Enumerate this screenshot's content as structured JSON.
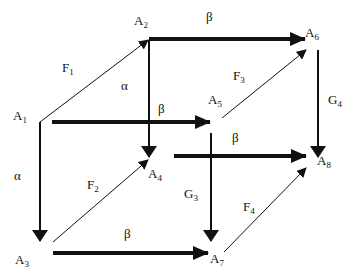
{
  "diagram": {
    "type": "cube commutative diagram",
    "nodes": [
      {
        "id": "A1",
        "base": "A",
        "sub": "1",
        "x": 14,
        "y": 118
      },
      {
        "id": "A2",
        "base": "A",
        "sub": "2",
        "x": 135,
        "y": 23
      },
      {
        "id": "A3",
        "base": "A",
        "sub": "3",
        "x": 16,
        "y": 262
      },
      {
        "id": "A4",
        "base": "A",
        "sub": "4",
        "x": 148,
        "y": 176
      },
      {
        "id": "A5",
        "base": "A",
        "sub": "5",
        "x": 207,
        "y": 103
      },
      {
        "id": "A6",
        "base": "A",
        "sub": "6",
        "x": 306,
        "y": 36
      },
      {
        "id": "A7",
        "base": "A",
        "sub": "7",
        "x": 210,
        "y": 261
      },
      {
        "id": "A8",
        "base": "A",
        "sub": "8",
        "x": 317,
        "y": 164
      }
    ],
    "edges": [
      {
        "from": "A1",
        "to": "A2",
        "label": "F",
        "label_sub": "1",
        "style": "thin"
      },
      {
        "from": "A3",
        "to": "A4",
        "label": "F",
        "label_sub": "2",
        "style": "thin"
      },
      {
        "from": "A5",
        "to": "A6",
        "label": "F",
        "label_sub": "3",
        "style": "thin"
      },
      {
        "from": "A7",
        "to": "A8",
        "label": "F",
        "label_sub": "4",
        "style": "thin"
      },
      {
        "from": "A1",
        "to": "A3",
        "label": "α",
        "style": "medium"
      },
      {
        "from": "A2",
        "to": "A4",
        "label": "α",
        "style": "medium"
      },
      {
        "from": "A5",
        "to": "A7",
        "label": "G",
        "label_sub": "3",
        "style": "medium"
      },
      {
        "from": "A6",
        "to": "A8",
        "label": "G",
        "label_sub": "4",
        "style": "medium"
      },
      {
        "from": "A1",
        "to": "A5",
        "label": "β",
        "style": "thick"
      },
      {
        "from": "A2",
        "to": "A6",
        "label": "β",
        "style": "thick"
      },
      {
        "from": "A3",
        "to": "A7",
        "label": "β",
        "style": "thick"
      },
      {
        "from": "A4",
        "to": "A8",
        "label": "β",
        "style": "thick"
      }
    ]
  },
  "labels": {
    "a1": "A",
    "a1_sub": "1",
    "a2": "A",
    "a2_sub": "2",
    "a3": "A",
    "a3_sub": "3",
    "a4": "A",
    "a4_sub": "4",
    "a5": "A",
    "a5_sub": "5",
    "a6": "A",
    "a6_sub": "6",
    "a7": "A",
    "a7_sub": "7",
    "a8": "A",
    "a8_sub": "8",
    "f1": "F",
    "f1_sub": "1",
    "f2": "F",
    "f2_sub": "2",
    "f3": "F",
    "f3_sub": "3",
    "f4": "F",
    "f4_sub": "4",
    "g3": "G",
    "g3_sub": "3",
    "g4": "G",
    "g4_sub": "4",
    "alpha_left": "α",
    "alpha_back": "α",
    "beta_top": "β",
    "beta_mid": "β",
    "beta_right": "β",
    "beta_bottom": "β"
  },
  "colors": {
    "line": "#111111",
    "background": "#ffffff"
  }
}
